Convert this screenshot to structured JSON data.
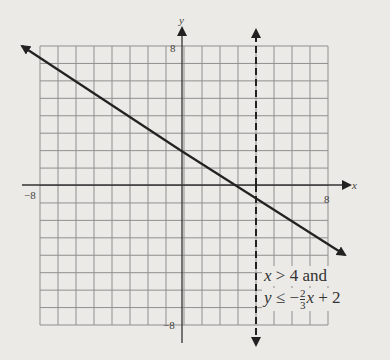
{
  "chart_data": {
    "type": "line",
    "title": "",
    "xlabel": "x",
    "ylabel": "y",
    "xlim": [
      -8,
      8
    ],
    "ylim": [
      -8,
      8
    ],
    "grid": true,
    "tick_labels": {
      "x_min": "−8",
      "x_max": "8",
      "y_min": "−8",
      "y_max": "8"
    },
    "series": [
      {
        "name": "y = -2/3 x + 2",
        "style": "solid",
        "slope": -0.6667,
        "intercept": 2,
        "points": [
          [
            -8.8,
            7.87
          ],
          [
            9,
            -4
          ]
        ]
      },
      {
        "name": "x = 4",
        "style": "dashed",
        "x": 4
      }
    ],
    "annotation": {
      "line1": "x > 4 and",
      "line2_prefix": "y ≤ −",
      "frac_num": "2",
      "frac_den": "3",
      "line2_suffix": "x + 2"
    }
  },
  "colors": {
    "grid": "#8a8a8a",
    "axis": "#333333",
    "line": "#222222",
    "background": "#eceae6"
  }
}
